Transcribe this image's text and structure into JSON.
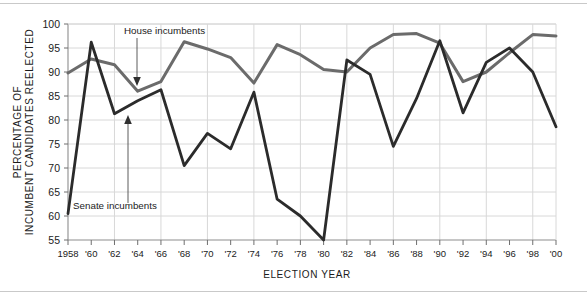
{
  "figure": {
    "axis_titles": {
      "y_line1": "PERCENTAGE OF",
      "y_line2": "INCUMBENT CANDIDATES REELECTED",
      "x": "ELECTION YEAR"
    },
    "annotations": {
      "house": "House incumbents",
      "senate": "Senate incumbents"
    }
  },
  "chart_data": {
    "type": "line",
    "title": "",
    "xlabel": "ELECTION YEAR",
    "ylabel": "PERCENTAGE OF INCUMBENT CANDIDATES REELECTED",
    "xlim": [
      1958,
      2000
    ],
    "ylim": [
      55,
      100
    ],
    "y_ticks": [
      55,
      60,
      65,
      70,
      75,
      80,
      85,
      90,
      95,
      100
    ],
    "grid": true,
    "legend_position": "inline-annotations",
    "x": [
      1958,
      1960,
      1962,
      1964,
      1966,
      1968,
      1970,
      1972,
      1974,
      1976,
      1978,
      1980,
      1982,
      1984,
      1986,
      1988,
      1990,
      1992,
      1994,
      1996,
      1998,
      2000
    ],
    "x_tick_labels": [
      "1958",
      "'60",
      "'62",
      "'64",
      "'66",
      "'68",
      "'70",
      "'72",
      "'74",
      "'76",
      "'78",
      "'80",
      "'82",
      "'84",
      "'86",
      "'88",
      "'90",
      "'92",
      "'94",
      "'96",
      "'98",
      "'00"
    ],
    "series": [
      {
        "name": "House incumbents",
        "color": "#6b6b6b",
        "values": [
          89.8,
          92.7,
          91.5,
          86.0,
          88.0,
          96.3,
          94.8,
          93.0,
          87.7,
          95.7,
          93.6,
          90.5,
          90.0,
          95.0,
          97.8,
          98.0,
          96.0,
          88.0,
          90.0,
          94.0,
          97.8,
          97.5
        ]
      },
      {
        "name": "Senate incumbents",
        "color": "#2b2b2b",
        "values": [
          60.5,
          96.2,
          81.3,
          84.0,
          86.3,
          70.5,
          77.2,
          74.0,
          85.8,
          63.5,
          60.0,
          55.0,
          92.5,
          89.5,
          74.5,
          84.5,
          96.5,
          81.5,
          92.0,
          95.0,
          90.0,
          78.6
        ]
      }
    ]
  }
}
